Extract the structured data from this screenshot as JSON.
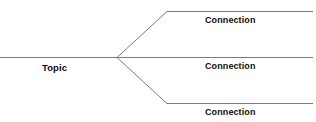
{
  "diagram": {
    "type": "concept-map",
    "canvas": {
      "width": 316,
      "height": 122,
      "background": "#ffffff"
    },
    "line_color": "#7a7a7a",
    "line_width": 1,
    "text_color": "#0d0d0d",
    "root": {
      "label": "Topic",
      "trunk_start_x": 0,
      "trunk_end_x": 117,
      "trunk_y": 57,
      "label_x": 42,
      "label_y": 62
    },
    "vertex": {
      "x": 117,
      "y": 57
    },
    "branches": [
      {
        "label": "Connection",
        "direction": "up",
        "elbow_x": 167,
        "elbow_y": 11,
        "end_x": 313,
        "label_x": 205,
        "label_y": 15
      },
      {
        "label": "Connection",
        "direction": "straight",
        "elbow_x": 117,
        "elbow_y": 57,
        "end_x": 313,
        "label_x": 205,
        "label_y": 61
      },
      {
        "label": "Connection",
        "direction": "down",
        "elbow_x": 167,
        "elbow_y": 103,
        "end_x": 313,
        "label_x": 205,
        "label_y": 107
      }
    ]
  }
}
